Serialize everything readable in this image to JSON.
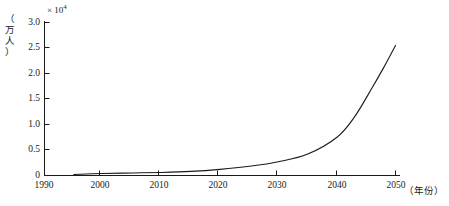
{
  "chart_data": {
    "type": "line",
    "title": "",
    "subtitle": "",
    "xlabel": "（年份）",
    "ylabel": "（万人）",
    "y_multiplier": "× 10",
    "y_multiplier_exponent": "4",
    "xlim": [
      1990,
      2050
    ],
    "ylim": [
      0,
      3.0
    ],
    "grid": false,
    "legend": false,
    "legend_position": "none",
    "x_ticks": [
      1990,
      2000,
      2010,
      2020,
      2030,
      2040,
      2050
    ],
    "x_tick_labels": [
      "1990",
      "2000",
      "2010",
      "2020",
      "2030",
      "2040",
      "2050"
    ],
    "y_ticks": [
      0,
      0.5,
      1.0,
      1.5,
      2.0,
      2.5,
      3.0
    ],
    "y_tick_labels": [
      "0",
      "0.5",
      "1.0",
      "1.5",
      "2.0",
      "2.5",
      "3.0"
    ],
    "series": [
      {
        "name": "population",
        "color": "#1a1a1a",
        "x": [
          1995,
          2000,
          2005,
          2010,
          2015,
          2020,
          2025,
          2030,
          2035,
          2040,
          2043,
          2046,
          2048,
          2050
        ],
        "values": [
          0.02,
          0.04,
          0.05,
          0.06,
          0.08,
          0.12,
          0.18,
          0.27,
          0.42,
          0.75,
          1.15,
          1.72,
          2.12,
          2.55
        ]
      }
    ]
  },
  "axis": {
    "y_title_chars": [
      "（",
      "万",
      "人",
      "）"
    ]
  }
}
